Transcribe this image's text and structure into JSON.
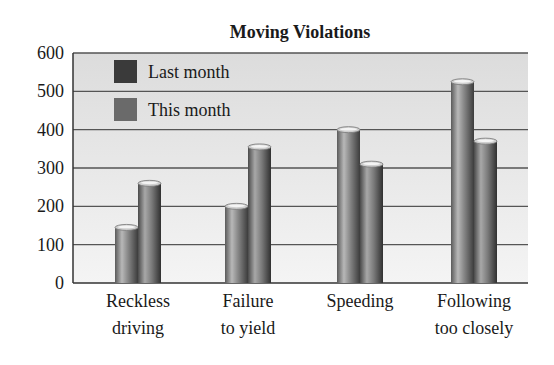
{
  "chart_data": {
    "type": "bar",
    "title": "Moving Violations",
    "xlabel": "",
    "ylabel": "",
    "categories": [
      [
        "Reckless",
        "driving"
      ],
      [
        "Failure",
        "to yield"
      ],
      [
        "Speeding"
      ],
      [
        "Following",
        "too closely"
      ]
    ],
    "series": [
      {
        "name": "Last month",
        "values": [
          145,
          200,
          400,
          525
        ],
        "color": "#3a3a3a"
      },
      {
        "name": "This month",
        "values": [
          260,
          355,
          310,
          370
        ],
        "color": "#6a6a6a"
      }
    ],
    "ylim": [
      0,
      600
    ],
    "yticks": [
      0,
      100,
      200,
      300,
      400,
      500,
      600
    ],
    "grid": true,
    "legend_position": "top-left",
    "bar_style": "cylinder"
  }
}
